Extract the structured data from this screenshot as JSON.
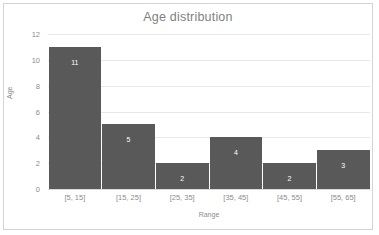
{
  "chart_data": {
    "type": "bar",
    "title": "Age distribution",
    "xlabel": "Range",
    "ylabel": "Age",
    "categories": [
      "[5, 15]",
      "[15, 25]",
      "[25, 35]",
      "[35, 45]",
      "[45, 55]",
      "[55, 65]"
    ],
    "values": [
      11,
      5,
      2,
      4,
      2,
      3
    ],
    "value_labels": [
      "11",
      "5",
      "2",
      "4",
      "2",
      "3"
    ],
    "ylim": [
      0,
      12
    ],
    "yticks": [
      0,
      2,
      4,
      6,
      8,
      10,
      12
    ],
    "ytick_labels": [
      "0",
      "2",
      "4",
      "6",
      "8",
      "10",
      "12"
    ],
    "grid": "horizontal",
    "legend": "none",
    "bar_color": "#595959",
    "gridline_color": "#e8e8e8",
    "text_color": "#8c8c8c",
    "title_color": "#7f7f7f",
    "data_label_color": "#ffffff",
    "border_color": "#d4d4d4",
    "background": "#ffffff"
  }
}
